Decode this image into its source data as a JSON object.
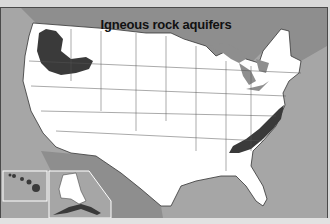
{
  "map": {
    "title": "Igneous rock aquifers",
    "legend_colors": {
      "aquifer": "#3a3a3a",
      "land": "#ffffff",
      "ocean": "#a6a6a6",
      "canada_mexico": "#8e8e8e",
      "state_borders": "#555555"
    },
    "regions": [
      {
        "name": "Columbia Plateau / Snake River Plain",
        "area": "Pacific Northwest (WA, OR, ID)",
        "present": true
      },
      {
        "name": "Piedmont / Blue Ridge igneous rocks",
        "area": "Eastern US (VA, NC, SC, GA)",
        "present": true
      },
      {
        "name": "Hawaii volcanic aquifers",
        "area": "Hawaii inset",
        "present": true
      },
      {
        "name": "Alaska Peninsula / Aleutians",
        "area": "Alaska inset",
        "present": true
      }
    ],
    "insets": [
      "Hawaii",
      "Alaska"
    ]
  }
}
